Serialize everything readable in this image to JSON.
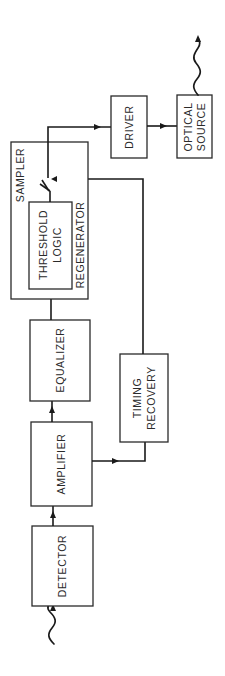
{
  "diagram": {
    "type": "block-diagram",
    "orientation": "rotated-90-ccw",
    "blocks": {
      "detector": "DETECTOR",
      "amplifier": "AMPLIFIER",
      "equalizer": "EQUALIZER",
      "timing_recovery_line1": "TIMING",
      "timing_recovery_line2": "RECOVERY",
      "threshold_line1": "THRESHOLD",
      "threshold_line2": "LOGIC",
      "sampler": "SAMPLER",
      "regenerator": "REGENERATOR",
      "driver": "DRIVER",
      "optical_source_line1": "OPTICAL",
      "optical_source_line2": "SOURCE"
    },
    "signal_flow": [
      "optical input",
      "DETECTOR",
      "AMPLIFIER",
      "EQUALIZER",
      "THRESHOLD LOGIC",
      "SAMPLER",
      "DRIVER",
      "OPTICAL SOURCE",
      "optical output"
    ],
    "side_branch": [
      "AMPLIFIER",
      "TIMING RECOVERY",
      "SAMPLER"
    ],
    "colors": {
      "line": "#1a1a1a",
      "background": "#ffffff"
    }
  }
}
